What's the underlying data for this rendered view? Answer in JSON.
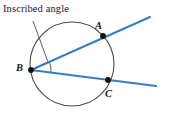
{
  "figure": {
    "type": "geometry-diagram",
    "callout": {
      "text": "Inscribed angle",
      "leader_from": [
        33,
        21
      ],
      "leader_to": [
        48,
        62
      ]
    },
    "background_color": "#ffffff",
    "circle": {
      "name": "circle",
      "center": [
        72,
        64
      ],
      "radius": 42,
      "stroke": "#4a4a4a",
      "stroke_width": 1.1,
      "fill": "none"
    },
    "vertex": {
      "name": "B",
      "label": "B",
      "x": 31,
      "y": 70
    },
    "points": [
      {
        "name": "A",
        "label": "A",
        "x": 103,
        "y": 36,
        "marker": "filled-dot"
      },
      {
        "name": "B",
        "label": "B",
        "x": 31,
        "y": 70,
        "marker": "filled-dot"
      },
      {
        "name": "C",
        "label": "C",
        "x": 108,
        "y": 80,
        "marker": "filled-dot"
      }
    ],
    "rays": [
      {
        "name": "ray-BA",
        "from": [
          31,
          70
        ],
        "to": [
          150,
          17
        ],
        "through": "A",
        "color": "#3a7cc0",
        "stroke_width": 2.1
      },
      {
        "name": "ray-BC",
        "from": [
          31,
          70
        ],
        "to": [
          156,
          86
        ],
        "through": "C",
        "color": "#3a7cc0",
        "stroke_width": 2.1
      }
    ],
    "angle_arc": {
      "name": "angle-arc-B",
      "vertex": [
        31,
        70
      ],
      "radius": 20,
      "stroke": "#4a4a4a",
      "stroke_width": 0.9
    },
    "colors": {
      "ray_blue": "#3a7cc0",
      "circle_gray": "#4a4a4a",
      "text_black": "#1a1a1a",
      "point_black": "#111111"
    }
  }
}
